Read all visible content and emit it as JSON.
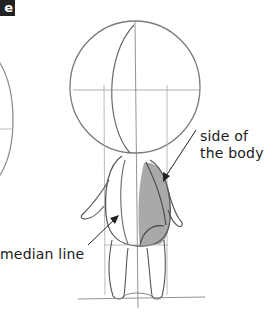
{
  "figure": {
    "badge_text": "e",
    "colors": {
      "badge_bg": "#222222",
      "badge_text": "#ffffff",
      "sketch_line": "#7a7a7a",
      "dark_line": "#333333",
      "shading": "#a9a9a9",
      "arrow": "#222222",
      "label_text": "#1a1a1a"
    },
    "annotations": {
      "side_of_body": "side of the body",
      "median_line": "median line"
    }
  }
}
